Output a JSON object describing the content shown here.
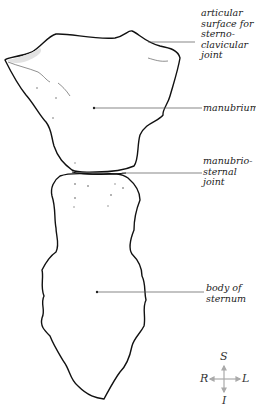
{
  "diagram": {
    "labels": [
      {
        "id": "articular-surface",
        "text": "articular\nsurface for\nsterno-\nclavicular\njoint"
      },
      {
        "id": "manubrium",
        "text": "manubrium"
      },
      {
        "id": "manubriosternal-joint",
        "text": "manubrio-\nsternal\njoint"
      },
      {
        "id": "body-of-sternum",
        "text": "body of\nsternum"
      }
    ],
    "compass": {
      "superior": "S",
      "inferior": "I",
      "right": "R",
      "left": "L"
    },
    "colors": {
      "outline": "#111111",
      "leader_line": "#555555",
      "compass": "#aaaaaa",
      "text": "#222222"
    }
  }
}
